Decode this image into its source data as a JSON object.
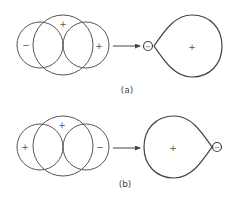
{
  "diagram": {
    "stroke_color": "#555555",
    "panels": [
      {
        "id": "a",
        "label": "(a)",
        "left_orbitals": {
          "left_sign": "−",
          "middle_sign": "+",
          "right_sign": "+"
        },
        "hybrid": {
          "small_lobe_sign": "−",
          "large_lobe_sign": "+",
          "small_lobe_side": "left"
        }
      },
      {
        "id": "b",
        "label": "(b)",
        "left_orbitals": {
          "left_sign": "+",
          "middle_sign": "+",
          "right_sign": "−"
        },
        "hybrid": {
          "small_lobe_sign": "−",
          "large_lobe_sign": "+",
          "small_lobe_side": "right"
        }
      }
    ]
  }
}
